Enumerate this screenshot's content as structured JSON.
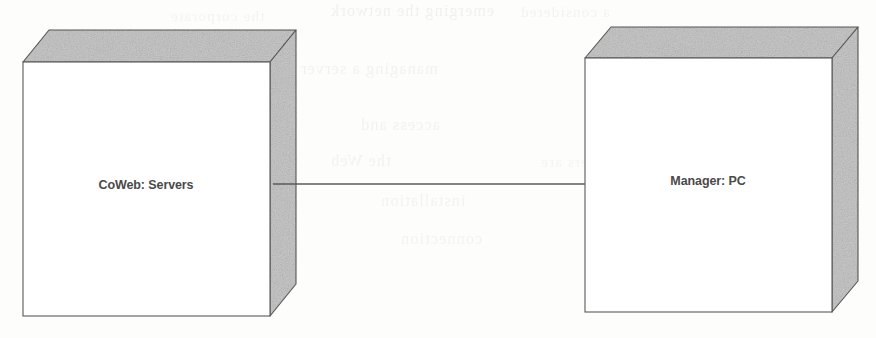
{
  "diagram": {
    "kind": "uml-deployment-diagram",
    "background_color": "#fdfdfc",
    "stroke_color": "#5a5a5a",
    "face_fill_color": "#c9c9c9",
    "front_fill_color": "#ffffff",
    "label_color": "#4a4a4a",
    "nodes": [
      {
        "id": "coweb-servers",
        "label": "CoWeb: Servers",
        "shape": "3d-box",
        "label_x": 146,
        "label_y": 189,
        "front": {
          "x": 23,
          "y": 62,
          "width": 247,
          "height": 254
        },
        "depth_x": 26,
        "depth_y": 32
      },
      {
        "id": "manager-pc",
        "label": "Manager: PC",
        "shape": "3d-box",
        "label_x": 708,
        "label_y": 185,
        "front": {
          "x": 585,
          "y": 58,
          "width": 247,
          "height": 254
        },
        "depth_x": 26,
        "depth_y": 31
      }
    ],
    "connections": [
      {
        "id": "coweb-to-manager",
        "kind": "association",
        "from": "coweb-servers",
        "to": "manager-pc",
        "x1": 273,
        "y1": 184,
        "x2": 585,
        "y2": 184
      }
    ],
    "bleed_through": [
      {
        "text": "emerging the network",
        "x": 330,
        "y": 2,
        "size": 16,
        "opacity": 0.55
      },
      {
        "text": "a considered",
        "x": 520,
        "y": 4,
        "size": 15,
        "opacity": 0.45
      },
      {
        "text": "the corporate",
        "x": 170,
        "y": 8,
        "size": 15,
        "opacity": 0.4
      },
      {
        "text": "managing a server",
        "x": 300,
        "y": 60,
        "size": 16,
        "opacity": 0.5
      },
      {
        "text": "one",
        "x": 690,
        "y": 62,
        "size": 15,
        "opacity": 0.4
      },
      {
        "text": "access and",
        "x": 360,
        "y": 116,
        "size": 16,
        "opacity": 0.5
      },
      {
        "text": "be set",
        "x": 640,
        "y": 118,
        "size": 15,
        "opacity": 0.42
      },
      {
        "text": "the Web",
        "x": 330,
        "y": 152,
        "size": 16,
        "opacity": 0.48
      },
      {
        "text": "servers are",
        "x": 540,
        "y": 154,
        "size": 15,
        "opacity": 0.4
      },
      {
        "text": "installation",
        "x": 380,
        "y": 192,
        "size": 16,
        "opacity": 0.46
      },
      {
        "text": "the site",
        "x": 620,
        "y": 196,
        "size": 15,
        "opacity": 0.4
      },
      {
        "text": "connection",
        "x": 400,
        "y": 230,
        "size": 16,
        "opacity": 0.44
      }
    ]
  }
}
